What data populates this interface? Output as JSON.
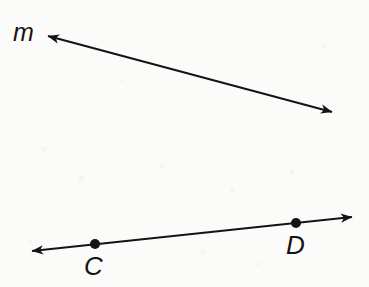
{
  "figure": {
    "kind": "geometry-diagram",
    "background_color": "#fbfbfa",
    "ink_color": "#141414"
  },
  "labels": {
    "line_m": "m",
    "point_c": "C",
    "point_d": "D"
  },
  "chart_data": {
    "type": "scatter",
    "title": "",
    "xlabel": "",
    "ylabel": "",
    "xlim": [
      0,
      369
    ],
    "ylim": [
      287,
      0
    ],
    "grid": false,
    "legend": "none",
    "annotations": [
      {
        "text": "m",
        "x": 25,
        "y": 33
      },
      {
        "text": "C",
        "x": 96,
        "y": 265
      },
      {
        "text": "D",
        "x": 297,
        "y": 245
      }
    ],
    "series": [
      {
        "name": "line m",
        "type": "line",
        "arrow_start": true,
        "arrow_end": true,
        "x": [
          48,
          332
        ],
        "y": [
          36,
          112
        ]
      },
      {
        "name": "line CD",
        "type": "line",
        "arrow_start": true,
        "arrow_end": true,
        "x": [
          32,
          352
        ],
        "y": [
          251,
          217
        ]
      }
    ],
    "points": [
      {
        "name": "C",
        "x": 95,
        "y": 244,
        "marker": "filled-circle",
        "radius": 5
      },
      {
        "name": "D",
        "x": 296,
        "y": 223,
        "marker": "filled-circle",
        "radius": 5
      }
    ]
  }
}
